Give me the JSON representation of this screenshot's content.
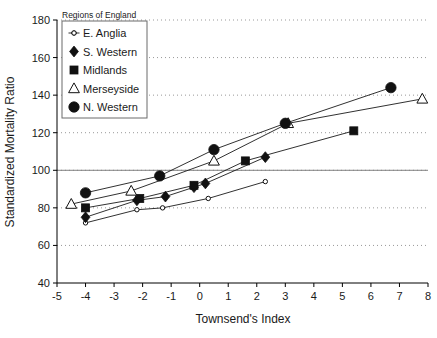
{
  "chart_data": {
    "type": "line",
    "title": "",
    "xlabel": "Townsend's Index",
    "ylabel": "Standardized Mortality Ratio",
    "xlim": [
      -5,
      8
    ],
    "ylim": [
      40,
      180
    ],
    "xticks": [
      "-5",
      "-4",
      "-3",
      "-2",
      "-1",
      "0",
      "1",
      "2",
      "3",
      "4",
      "5",
      "6",
      "7",
      "8"
    ],
    "yticks": [
      "40",
      "60",
      "80",
      "100",
      "120",
      "140",
      "160",
      "180"
    ],
    "grid": "horizontal-dotted",
    "reference_line": 100,
    "legend_position": "top-left",
    "legend_title": "Regions of England",
    "series": [
      {
        "name": "E. Anglia",
        "marker": "open-circle-small",
        "points": [
          {
            "x": -4.0,
            "y": 72
          },
          {
            "x": -2.2,
            "y": 79
          },
          {
            "x": -1.3,
            "y": 80
          },
          {
            "x": 0.3,
            "y": 85
          },
          {
            "x": 2.3,
            "y": 94
          }
        ]
      },
      {
        "name": "S. Western",
        "marker": "filled-diamond",
        "points": [
          {
            "x": -4.0,
            "y": 75
          },
          {
            "x": -2.2,
            "y": 84
          },
          {
            "x": -1.2,
            "y": 86
          },
          {
            "x": -0.2,
            "y": 91
          },
          {
            "x": 0.2,
            "y": 93
          },
          {
            "x": 2.3,
            "y": 107
          }
        ]
      },
      {
        "name": "Midlands",
        "marker": "filled-square",
        "points": [
          {
            "x": -4.0,
            "y": 80
          },
          {
            "x": -2.1,
            "y": 85
          },
          {
            "x": -0.2,
            "y": 92
          },
          {
            "x": 1.6,
            "y": 105
          },
          {
            "x": 5.4,
            "y": 121
          }
        ]
      },
      {
        "name": "Merseyside",
        "marker": "open-triangle",
        "points": [
          {
            "x": -4.5,
            "y": 82
          },
          {
            "x": -2.4,
            "y": 89
          },
          {
            "x": 0.5,
            "y": 105
          },
          {
            "x": 3.1,
            "y": 125
          },
          {
            "x": 7.8,
            "y": 138
          }
        ]
      },
      {
        "name": "N. Western",
        "marker": "filled-circle",
        "points": [
          {
            "x": -4.0,
            "y": 88
          },
          {
            "x": -1.4,
            "y": 97
          },
          {
            "x": 0.5,
            "y": 111
          },
          {
            "x": 3.0,
            "y": 125
          },
          {
            "x": 6.7,
            "y": 144
          }
        ]
      }
    ]
  },
  "colors": {
    "marker": "#111111",
    "line": "#1a1a1a",
    "grid": "#999999",
    "reference": "#808080",
    "background": "#ffffff"
  }
}
